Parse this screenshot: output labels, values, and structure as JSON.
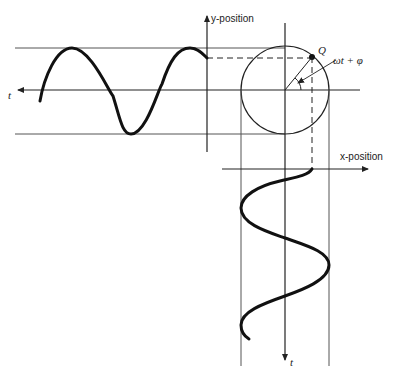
{
  "diagram": {
    "labels": {
      "y_axis": "y-position",
      "x_axis": "x-position",
      "t_horizontal": "t",
      "t_vertical": "t",
      "point": "Q",
      "angle": "ωt + φ"
    },
    "geometry": {
      "circle_center": [
        285,
        90
      ],
      "radius": 44,
      "point_Q": [
        312,
        57
      ]
    },
    "colors": {
      "line": "#222222",
      "curve": "#111111",
      "guide": "#555555"
    }
  }
}
